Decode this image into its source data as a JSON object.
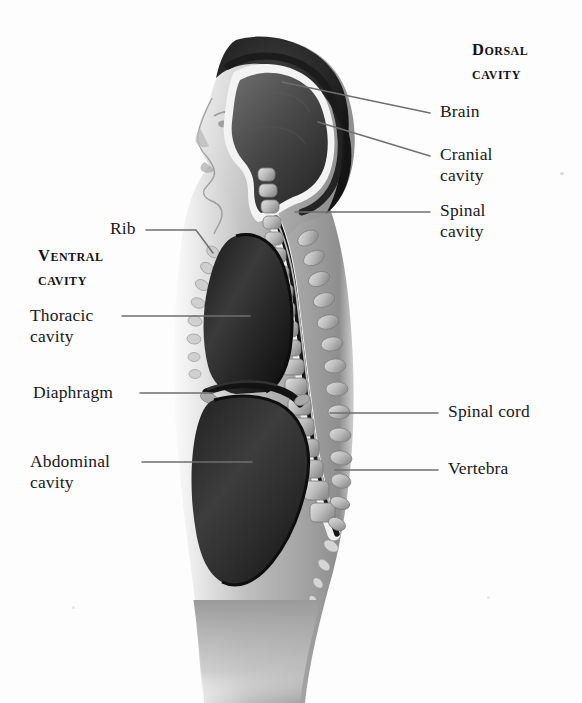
{
  "figure": {
    "view": "lateral sagittal section of human body",
    "background_color": "#fdfdfd",
    "text_color": "#18181a",
    "leader_line_color": "#6f6f72"
  },
  "headings": {
    "dorsal": "Dorsal\ncavity",
    "ventral": "Ventral\ncavity"
  },
  "labels": {
    "brain": "Brain",
    "cranial_cavity": "Cranial\ncavity",
    "spinal_cavity": "Spinal\ncavity",
    "spinal_cord": "Spinal cord",
    "vertebra": "Vertebra",
    "rib": "Rib",
    "thoracic_cavity": "Thoracic\ncavity",
    "diaphragm": "Diaphragm",
    "abdominal_cavity": "Abdominal\ncavity"
  },
  "anatomy_parts": [
    "brain",
    "cranial cavity",
    "spinal cavity",
    "spinal cord",
    "vertebra",
    "rib",
    "thoracic cavity",
    "diaphragm",
    "abdominal cavity"
  ]
}
